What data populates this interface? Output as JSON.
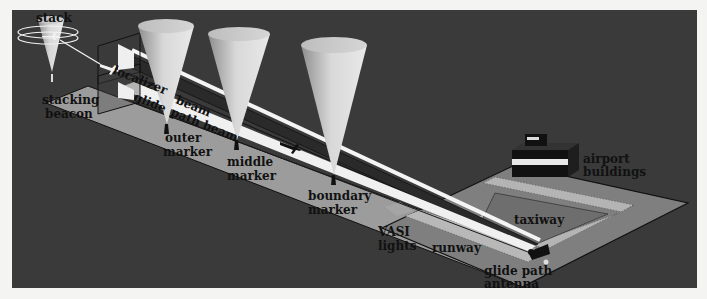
{
  "diagram": {
    "colors": {
      "page_background": "#f4f4f2",
      "panel_background": "#3a3a3a",
      "ground_strip": "#9a9a9a",
      "airport_platform": "#7e7e7e",
      "beam_white": "#f2f2f2",
      "cone_fill": "#cfcfcf",
      "label_text": "#111111"
    },
    "labels": {
      "stack": "stack",
      "stacking_beacon_line1": "stacking",
      "stacking_beacon_line2": "beacon",
      "localizer": "localizer",
      "beam_upper": "beam",
      "glide": "glide",
      "path_beam": "path beam",
      "outer_marker_line1": "outer",
      "outer_marker_line2": "marker",
      "middle_marker_line1": "middle",
      "middle_marker_line2": "marker",
      "boundary_marker_line1": "boundary",
      "boundary_marker_line2": "marker",
      "vasi_line1": "VASI",
      "vasi_line2": "lights",
      "runway": "runway",
      "taxiway": "taxiway",
      "glide_path_antenna_line1": "glide path",
      "glide_path_antenna_line2": "antenna",
      "airport_buildings_line1": "airport",
      "airport_buildings_line2": "buildings"
    },
    "components": [
      "stack",
      "stacking beacon",
      "localizer beam",
      "glide path beam",
      "outer marker",
      "middle marker",
      "boundary marker",
      "VASI lights",
      "runway",
      "taxiway",
      "glide path antenna",
      "airport buildings"
    ]
  }
}
